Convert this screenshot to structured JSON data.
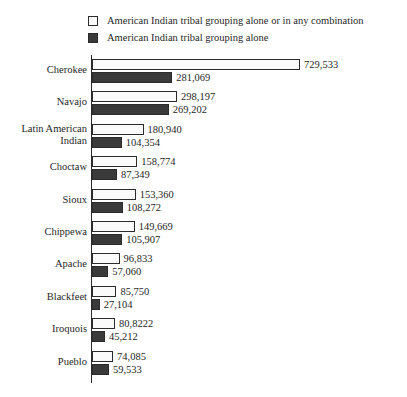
{
  "chart_data": {
    "type": "bar",
    "orientation": "horizontal",
    "title": "",
    "xlabel": "",
    "ylabel": "",
    "grid": false,
    "legend_position": "top",
    "xlim": [
      0,
      729533
    ],
    "categories": [
      "Cherokee",
      "Navajo",
      "Latin American\nIndian",
      "Choctaw",
      "Sioux",
      "Chippewa",
      "Apache",
      "Blackfeet",
      "Iroquois",
      "Pueblo"
    ],
    "series": [
      {
        "name": "American Indian tribal grouping alone or in any combination",
        "values": [
          729533,
          298197,
          180940,
          158774,
          153360,
          149669,
          96833,
          85750,
          80822,
          74085
        ],
        "labels": [
          "729,533",
          "298,197",
          "180,940",
          "158,774",
          "153,360",
          "149,669",
          "96,833",
          "85,750",
          "80,8222",
          "74,085"
        ],
        "color": "#fafafa"
      },
      {
        "name": "American Indian tribal grouping alone",
        "values": [
          281069,
          269202,
          104354,
          87349,
          108272,
          105907,
          57060,
          27104,
          45212,
          59533
        ],
        "labels": [
          "281,069",
          "269,202",
          "104,354",
          "87,349",
          "108,272",
          "105,907",
          "57,060",
          "27,104",
          "45,212",
          "59,533"
        ],
        "color": "#3a3a3a"
      }
    ]
  },
  "legend": {
    "items": [
      {
        "label": "American Indian tribal grouping alone or in any combination",
        "swatch": "light"
      },
      {
        "label": "American Indian tribal grouping alone",
        "swatch": "dark"
      }
    ]
  },
  "colors": {
    "light_bar": "#fafafa",
    "dark_bar": "#3a3a3a",
    "outline": "#2b2b2b",
    "text": "#1f1f1f",
    "background": "#ffffff"
  }
}
